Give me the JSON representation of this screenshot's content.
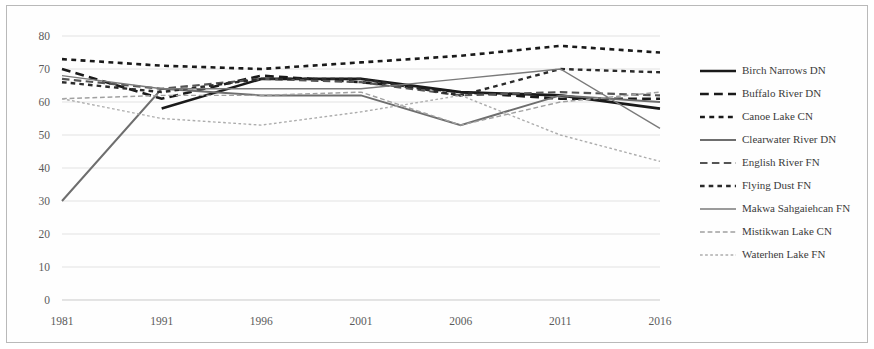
{
  "chart_data": {
    "type": "line",
    "title": "",
    "subtitle": "",
    "xlabel": "",
    "ylabel": "",
    "x": [
      "1981",
      "1991",
      "1996",
      "2001",
      "2006",
      "2011",
      "2016"
    ],
    "categories": [
      "1981",
      "1991",
      "1996",
      "2001",
      "2006",
      "2011",
      "2016"
    ],
    "xlim": [
      0,
      6
    ],
    "ylim": [
      0,
      80
    ],
    "y_ticks": [
      0,
      10,
      20,
      30,
      40,
      50,
      60,
      70,
      80
    ],
    "x_ticks": [
      "1981",
      "1991",
      "1996",
      "2001",
      "2006",
      "2011",
      "2016"
    ],
    "grid": true,
    "legend_position": "right",
    "series": [
      {
        "name": "Birch Narrows DN",
        "values": [
          null,
          58,
          67,
          67,
          63,
          62,
          58
        ],
        "color": "#1a1a1a",
        "width": 2.6,
        "dash": "none"
      },
      {
        "name": "Buffalo River DN",
        "values": [
          70,
          61,
          68,
          66,
          63,
          61,
          61
        ],
        "color": "#1a1a1a",
        "width": 2.6,
        "dash": "long"
      },
      {
        "name": "Canoe Lake CN",
        "values": [
          73,
          71,
          70,
          72,
          74,
          77,
          75
        ],
        "color": "#1a1a1a",
        "width": 2.6,
        "dash": "short"
      },
      {
        "name": "Clearwater River DN",
        "values": [
          30,
          64,
          62,
          62,
          53,
          62,
          60
        ],
        "color": "#6e6e6e",
        "width": 2.0,
        "dash": "none"
      },
      {
        "name": "English River FN",
        "values": [
          67,
          64,
          67,
          66,
          62,
          63,
          62
        ],
        "color": "#555555",
        "width": 2.2,
        "dash": "long"
      },
      {
        "name": "Flying Dust FN",
        "values": [
          66,
          63,
          67,
          67,
          62,
          70,
          69
        ],
        "color": "#2b2b2b",
        "width": 2.4,
        "dash": "short"
      },
      {
        "name": "Makwa Sahgaiehcan FN",
        "values": [
          68,
          64,
          64,
          64,
          67,
          70,
          52
        ],
        "color": "#7a7a7a",
        "width": 1.4,
        "dash": "none"
      },
      {
        "name": "Mistikwan Lake CN",
        "values": [
          61,
          62,
          62,
          63,
          53,
          60,
          63
        ],
        "color": "#a0a0a0",
        "width": 1.4,
        "dash": "long"
      },
      {
        "name": "Waterhen Lake FN",
        "values": [
          61,
          55,
          53,
          57,
          62,
          50,
          42
        ],
        "color": "#adadad",
        "width": 1.4,
        "dash": "short"
      }
    ],
    "annotations": []
  },
  "legend": {
    "entries": [
      "Birch Narrows DN",
      "Buffalo River DN",
      "Canoe Lake CN",
      "Clearwater River DN",
      "English River FN",
      "Flying Dust FN",
      "Makwa Sahgaiehcan FN",
      "Mistikwan Lake CN",
      "Waterhen Lake FN"
    ]
  }
}
